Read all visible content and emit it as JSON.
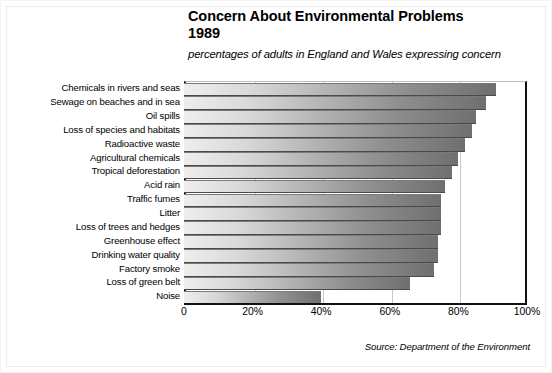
{
  "chart_data": {
    "type": "bar",
    "orientation": "horizontal",
    "title": "Concern About Environmental Problems\n1989",
    "subtitle": "percentages of adults in England and Wales expressing concern",
    "source": "Source: Department of the Environment",
    "xlabel": "",
    "ylabel": "",
    "xlim": [
      0,
      100
    ],
    "grid": true,
    "legend": false,
    "xticks": [
      "0",
      "20%",
      "40%",
      "60%",
      "80%",
      "100%"
    ],
    "xtick_values": [
      0,
      20,
      40,
      60,
      80,
      100
    ],
    "categories": [
      "Chemicals in rivers and seas",
      "Sewage on beaches and in sea",
      "Oil spills",
      "Loss of species and habitats",
      "Radioactive waste",
      "Agricultural chemicals",
      "Tropical deforestation",
      "Acid rain",
      "Traffic fumes",
      "Litter",
      "Loss of trees and hedges",
      "Greenhouse effect",
      "Drinking water quality",
      "Factory smoke",
      "Loss of green belt",
      "Noise"
    ],
    "values": [
      91,
      88,
      85,
      84,
      82,
      80,
      78,
      76,
      75,
      75,
      75,
      74,
      74,
      73,
      66,
      40
    ],
    "units": "percent",
    "bar_gradient": {
      "start": "#eeeeee",
      "end": "#6f6f6f"
    },
    "axis_color": "#111111",
    "gridline_color": "#c9c9c9"
  }
}
